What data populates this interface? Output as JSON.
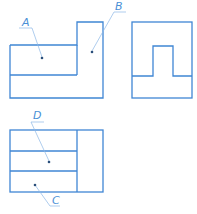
{
  "diagram": {
    "type": "orthographic-projection",
    "stroke_color": "#3f86d4",
    "leader_color": "#8db8e6",
    "views": {
      "front": {
        "name": "front-view",
        "labels": [
          "A",
          "B"
        ]
      },
      "side": {
        "name": "side-view",
        "labels": []
      },
      "top": {
        "name": "top-view",
        "labels": [
          "D",
          "C"
        ]
      }
    },
    "labels": {
      "A": "A",
      "B": "B",
      "C": "C",
      "D": "D"
    }
  }
}
